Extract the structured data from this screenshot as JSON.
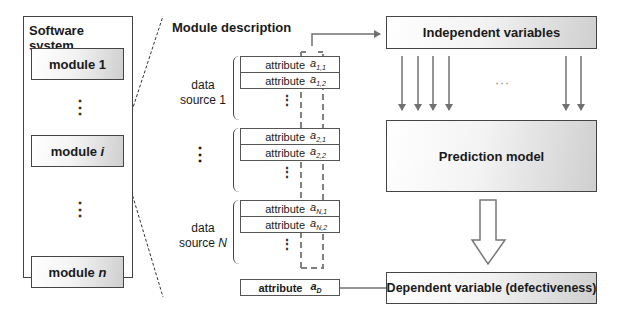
{
  "software_system": {
    "title": "Software system",
    "modules": [
      {
        "label": "module 1"
      },
      {
        "label": "module ",
        "italic": "i"
      },
      {
        "label": "module ",
        "italic": "n"
      }
    ],
    "ellipsis": "⋮"
  },
  "module_description": {
    "title": "Module description",
    "data_sources": [
      {
        "label_line1": "data",
        "label_line2": "source 1",
        "attributes": [
          {
            "label": "attribute",
            "symbol": "a",
            "sub": "1,1"
          },
          {
            "label": "attribute",
            "symbol": "a",
            "sub": "1,2"
          }
        ]
      },
      {
        "label_line1": "⋮",
        "label_line2": "",
        "attributes": [
          {
            "label": "attribute",
            "symbol": "a",
            "sub": "2,1"
          },
          {
            "label": "attribute",
            "symbol": "a",
            "sub": "2,2"
          }
        ]
      },
      {
        "label_line1": "data",
        "label_line2": "source N",
        "attributes": [
          {
            "label": "attribute",
            "symbol": "a",
            "sub": "N,1"
          },
          {
            "label": "attribute",
            "symbol": "a",
            "sub": "N,2"
          }
        ]
      }
    ],
    "dependent_attribute": {
      "label": "attribute",
      "symbol": "a",
      "sub": "D"
    },
    "ellipsis": "⋮"
  },
  "independent_variables": {
    "label": "Independent variables"
  },
  "arrows_ellipsis": "···",
  "prediction_model": {
    "label": "Prediction model"
  },
  "dependent_variable": {
    "label": "Dependent variable (defectiveness)"
  },
  "colors": {
    "border": "#444444",
    "arrow": "#707070",
    "dashed": "#808080",
    "panel_gradient_end": "#cfcfcf"
  }
}
